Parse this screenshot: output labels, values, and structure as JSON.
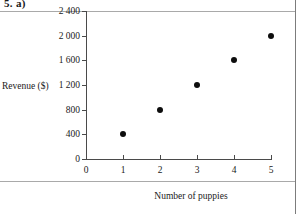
{
  "page": {
    "question_label": "5. a)",
    "background": "#ffffff",
    "rule_color": "#9a9a9a"
  },
  "chart_data": {
    "type": "scatter",
    "title": "",
    "xlabel": "Number of puppies",
    "ylabel": "Revenue ($)",
    "x": [
      1,
      2,
      3,
      4,
      5
    ],
    "values": [
      400,
      800,
      1200,
      1600,
      2000
    ],
    "series": [
      {
        "name": "Revenue",
        "points": [
          {
            "x": 1,
            "y": 400
          },
          {
            "x": 2,
            "y": 800
          },
          {
            "x": 3,
            "y": 1200
          },
          {
            "x": 4,
            "y": 1600
          },
          {
            "x": 5,
            "y": 2000
          }
        ]
      }
    ],
    "xlim": [
      0,
      5.4
    ],
    "ylim": [
      0,
      2400
    ],
    "xticks": [
      "0",
      "1",
      "2",
      "3",
      "4",
      "5"
    ],
    "xtick_values": [
      0,
      1,
      2,
      3,
      4,
      5
    ],
    "yticks": [
      "0",
      "400",
      "800",
      "1 200",
      "1 600",
      "2 000",
      "2 400"
    ],
    "ytick_values": [
      0,
      400,
      800,
      1200,
      1600,
      2000,
      2400
    ],
    "grid": false,
    "legend": null,
    "marker": "filled-circle",
    "marker_color": "#0d0d0d"
  }
}
